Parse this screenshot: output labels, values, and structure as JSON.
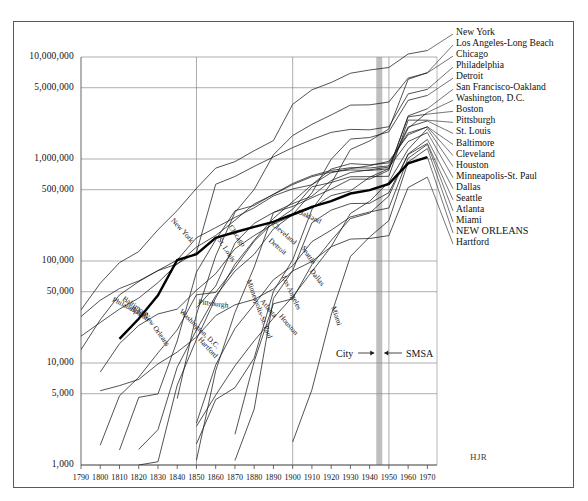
{
  "figure": {
    "signature": "HJR",
    "annotation": {
      "left_label": "City",
      "right_label": "SMSA",
      "band_year": 1945
    },
    "colors": {
      "ink": "#1a1a1a",
      "grid": "#8a8a8a",
      "frame": "#5a5a5a",
      "band": "#b4b4b4",
      "highlight": "#000000"
    }
  },
  "chart_data": {
    "type": "line",
    "title": "",
    "subtitle": "",
    "xlabel": "",
    "ylabel": "",
    "scale": {
      "x": "linear",
      "y": "log"
    },
    "xlim": [
      1790,
      1975
    ],
    "ylim": [
      1000,
      10000000
    ],
    "grid": "both",
    "legend": "right-labels",
    "annotations": [
      {
        "text": "City",
        "x": 1925,
        "y": 17000
      },
      {
        "text": "SMSA",
        "x": 1958,
        "y": 17000
      },
      {
        "text": "HJR",
        "x": 1968,
        "y": 1500
      }
    ],
    "ytick_labels": [
      "10,000,000",
      "5,000,000",
      "1,000,000",
      "500,000",
      "100,000",
      "50,000",
      "10,000",
      "5,000",
      "1,000"
    ],
    "ytick_values": [
      10000000,
      5000000,
      1000000,
      500000,
      100000,
      50000,
      10000,
      5000,
      1000
    ],
    "gridline_values": [
      10000000,
      5000000,
      1000000,
      500000,
      100000,
      50000,
      10000,
      5000,
      1000
    ],
    "xtick_labels": [
      "1790",
      "1800",
      "1810",
      "1820",
      "1830",
      "1840",
      "1850",
      "1860",
      "1870",
      "1880",
      "1890",
      "1900",
      "1910",
      "1920",
      "1930",
      "1940",
      "1950",
      "1960",
      "1970"
    ],
    "xtick_values": [
      1790,
      1800,
      1810,
      1820,
      1830,
      1840,
      1850,
      1860,
      1870,
      1880,
      1890,
      1900,
      1910,
      1920,
      1930,
      1940,
      1950,
      1960,
      1970
    ],
    "xgridline_values": [
      1850,
      1900,
      1950
    ],
    "highlight_series": "NEW ORLEANS",
    "series": [
      {
        "name": "New York",
        "right_label": "New York",
        "inline_label": "New York",
        "inline_at": 1838,
        "highlight": false,
        "x": [
          1790,
          1800,
          1810,
          1820,
          1830,
          1840,
          1850,
          1860,
          1870,
          1880,
          1890,
          1900,
          1910,
          1920,
          1930,
          1940,
          1950,
          1960,
          1970
        ],
        "y": [
          33131,
          60515,
          96373,
          123706,
          202589,
          312710,
          515547,
          813669,
          942292,
          1206299,
          1515301,
          3437202,
          4766883,
          5620048,
          6930446,
          7454995,
          7891957,
          10694633,
          11571899
        ]
      },
      {
        "name": "Los Angeles-Long Beach",
        "right_label": "Los Angeles-Long Beach",
        "inline_label": "Los Angeles",
        "inline_at": 1896,
        "highlight": false,
        "x": [
          1850,
          1860,
          1870,
          1880,
          1890,
          1900,
          1910,
          1920,
          1930,
          1940,
          1950,
          1960,
          1970
        ],
        "y": [
          1610,
          4385,
          5728,
          11183,
          50395,
          102479,
          319198,
          576673,
          1238048,
          1504277,
          1970358,
          6038771,
          7032075
        ]
      },
      {
        "name": "Chicago",
        "right_label": "Chicago",
        "inline_label": "Chicago",
        "inline_at": 1868,
        "highlight": false,
        "x": [
          1840,
          1850,
          1860,
          1870,
          1880,
          1890,
          1900,
          1910,
          1920,
          1930,
          1940,
          1950,
          1960,
          1970
        ],
        "y": [
          4470,
          29963,
          112172,
          298977,
          503185,
          1099850,
          1698575,
          2185283,
          2701705,
          3376438,
          3396808,
          3620962,
          6220913,
          6978947
        ]
      },
      {
        "name": "Philadelphia",
        "right_label": "Philadelphia",
        "inline_label": "Philadelphia",
        "inline_at": 1806,
        "highlight": false,
        "x": [
          1790,
          1800,
          1810,
          1820,
          1830,
          1840,
          1850,
          1860,
          1870,
          1880,
          1890,
          1900,
          1910,
          1920,
          1930,
          1940,
          1950,
          1960,
          1970
        ],
        "y": [
          28522,
          41220,
          53722,
          63802,
          80462,
          93665,
          121376,
          565529,
          674022,
          847170,
          1046964,
          1293697,
          1549008,
          1823779,
          1950961,
          1931334,
          2071605,
          4342897,
          4817914
        ]
      },
      {
        "name": "Detroit",
        "right_label": "Detroit",
        "inline_label": "Detroit",
        "inline_at": 1888,
        "highlight": false,
        "x": [
          1820,
          1830,
          1840,
          1850,
          1860,
          1870,
          1880,
          1890,
          1900,
          1910,
          1920,
          1930,
          1940,
          1950,
          1960,
          1970
        ],
        "y": [
          1422,
          2222,
          9102,
          21019,
          45619,
          79577,
          116340,
          205876,
          285704,
          465766,
          993678,
          1568662,
          1623452,
          1849568,
          3762360,
          4199931
        ]
      },
      {
        "name": "San Francisco-Oakland",
        "right_label": "San Francisco-Oakland",
        "inline_label": "Oakland",
        "inline_at": 1902,
        "highlight": false,
        "x": [
          1850,
          1860,
          1870,
          1880,
          1890,
          1900,
          1910,
          1920,
          1930,
          1940,
          1950,
          1960,
          1970
        ],
        "y": [
          34776,
          56802,
          149473,
          233959,
          298997,
          342782,
          416912,
          506676,
          634394,
          634536,
          775357,
          2648762,
          3109519
        ]
      },
      {
        "name": "Washington, D.C.",
        "right_label": "Washington, D.C.",
        "inline_label": "Washington, D.C.",
        "inline_at": 1842,
        "highlight": false,
        "x": [
          1800,
          1810,
          1820,
          1830,
          1840,
          1850,
          1860,
          1870,
          1880,
          1890,
          1900,
          1910,
          1920,
          1930,
          1940,
          1950,
          1960,
          1970
        ],
        "y": [
          8144,
          15471,
          23336,
          30261,
          33745,
          51687,
          75080,
          131700,
          177624,
          230392,
          278718,
          331069,
          437571,
          486869,
          663091,
          802178,
          2001897,
          2861123
        ]
      },
      {
        "name": "Boston",
        "right_label": "Boston",
        "inline_label": "Boston",
        "inline_at": 1816,
        "highlight": false,
        "x": [
          1790,
          1800,
          1810,
          1820,
          1830,
          1840,
          1850,
          1860,
          1870,
          1880,
          1890,
          1900,
          1910,
          1920,
          1930,
          1940,
          1950,
          1960,
          1970
        ],
        "y": [
          18320,
          24937,
          33787,
          43298,
          61392,
          93383,
          136881,
          177840,
          250526,
          362839,
          448477,
          560892,
          670585,
          748060,
          781188,
          770816,
          801444,
          2589301,
          2753700
        ]
      },
      {
        "name": "Pittsburgh",
        "right_label": "Pittsburgh",
        "inline_label": "Pittsburgh",
        "inline_at": 1850,
        "highlight": false,
        "x": [
          1800,
          1810,
          1820,
          1830,
          1840,
          1850,
          1860,
          1870,
          1880,
          1890,
          1900,
          1910,
          1920,
          1930,
          1940,
          1950,
          1960,
          1970
        ],
        "y": [
          1565,
          4768,
          7248,
          12568,
          21115,
          46601,
          49221,
          86076,
          156389,
          238617,
          321616,
          533905,
          588343,
          669817,
          671659,
          676806,
          2405435,
          2401245
        ]
      },
      {
        "name": "St. Louis",
        "right_label": "St. Louis",
        "inline_label": "St. Louis",
        "inline_at": 1862,
        "highlight": false,
        "x": [
          1810,
          1820,
          1830,
          1840,
          1850,
          1860,
          1870,
          1880,
          1890,
          1900,
          1910,
          1920,
          1930,
          1940,
          1950,
          1960,
          1970
        ],
        "y": [
          1400,
          4598,
          4977,
          16469,
          77860,
          160773,
          310864,
          350518,
          451770,
          575238,
          687029,
          772897,
          821960,
          816048,
          856796,
          2060103,
          2363017
        ]
      },
      {
        "name": "Baltimore",
        "right_label": "Baltimore",
        "inline_label": "Baltimore",
        "inline_at": 1812,
        "highlight": false,
        "x": [
          1790,
          1800,
          1810,
          1820,
          1830,
          1840,
          1850,
          1860,
          1870,
          1880,
          1890,
          1900,
          1910,
          1920,
          1930,
          1940,
          1950,
          1960,
          1970
        ],
        "y": [
          13503,
          26514,
          46555,
          62738,
          80620,
          102313,
          169054,
          212418,
          267354,
          332313,
          434439,
          508957,
          558485,
          733826,
          804874,
          859100,
          949708,
          1727023,
          2070670
        ]
      },
      {
        "name": "Cleveland",
        "right_label": "Cleveland",
        "inline_label": "Cleveland",
        "inline_at": 1890,
        "highlight": false,
        "x": [
          1820,
          1830,
          1840,
          1850,
          1860,
          1870,
          1880,
          1890,
          1900,
          1910,
          1920,
          1930,
          1940,
          1950,
          1960,
          1970
        ],
        "y": [
          606,
          1076,
          6071,
          17034,
          43417,
          92829,
          160146,
          261353,
          381768,
          560663,
          796841,
          900429,
          878336,
          914808,
          1796595,
          2064194
        ]
      },
      {
        "name": "Houston",
        "right_label": "Houston",
        "inline_label": "Houston",
        "inline_at": 1894,
        "highlight": false,
        "x": [
          1850,
          1860,
          1870,
          1880,
          1890,
          1900,
          1910,
          1920,
          1930,
          1940,
          1950,
          1960,
          1970
        ],
        "y": [
          2396,
          4845,
          9382,
          16513,
          27557,
          44633,
          78800,
          138276,
          292352,
          384514,
          596163,
          1243158,
          1985031
        ]
      },
      {
        "name": "Minneapolis-St. Paul",
        "right_label": "Minneapolis-St. Paul",
        "inline_label": "Minneapolis-St. Paul",
        "inline_at": 1878,
        "highlight": false,
        "x": [
          1850,
          1860,
          1870,
          1880,
          1890,
          1900,
          1910,
          1920,
          1930,
          1940,
          1950,
          1960,
          1970
        ],
        "y": [
          1112,
          8413,
          31278,
          87233,
          298300,
          365500,
          431500,
          615000,
          736000,
          784000,
          833000,
          1482030,
          1813647
        ]
      },
      {
        "name": "Dallas",
        "right_label": "Dallas",
        "inline_label": "Dallas",
        "inline_at": 1910,
        "highlight": false,
        "x": [
          1870,
          1880,
          1890,
          1900,
          1910,
          1920,
          1930,
          1940,
          1950,
          1960,
          1970
        ],
        "y": [
          2000,
          10358,
          38067,
          42638,
          92104,
          158976,
          260475,
          294734,
          434462,
          1119410,
          1555950
        ]
      },
      {
        "name": "Seattle",
        "right_label": "Seattle",
        "inline_label": "Seattle",
        "inline_at": 1906,
        "highlight": false,
        "x": [
          1870,
          1880,
          1890,
          1900,
          1910,
          1920,
          1930,
          1940,
          1950,
          1960,
          1970
        ],
        "y": [
          1107,
          3533,
          42837,
          80671,
          237194,
          315312,
          365583,
          368302,
          467591,
          1107213,
          1421869
        ]
      },
      {
        "name": "Atlanta",
        "right_label": "Atlanta",
        "inline_label": "Atlanta",
        "inline_at": 1884,
        "highlight": false,
        "x": [
          1850,
          1860,
          1870,
          1880,
          1890,
          1900,
          1910,
          1920,
          1930,
          1940,
          1950,
          1960,
          1970
        ],
        "y": [
          2572,
          9554,
          21789,
          37409,
          65533,
          89872,
          154839,
          200616,
          270366,
          302288,
          331314,
          1017188,
          1390164
        ]
      },
      {
        "name": "Miami",
        "right_label": "Miami",
        "inline_label": "Miami",
        "inline_at": 1922,
        "highlight": false,
        "x": [
          1900,
          1910,
          1920,
          1930,
          1940,
          1950,
          1960,
          1970
        ],
        "y": [
          1681,
          5471,
          29571,
          110637,
          172172,
          249276,
          935047,
          1267792
        ]
      },
      {
        "name": "NEW ORLEANS",
        "right_label": "NEW ORLEANS",
        "inline_label": "New Orleans",
        "inline_at": 1824,
        "highlight": true,
        "x": [
          1810,
          1820,
          1830,
          1840,
          1850,
          1860,
          1870,
          1880,
          1890,
          1900,
          1910,
          1920,
          1930,
          1940,
          1950,
          1960,
          1970
        ],
        "y": [
          17242,
          27176,
          46082,
          102193,
          116375,
          168675,
          191418,
          216090,
          242039,
          287104,
          339075,
          387219,
          458762,
          494537,
          570445,
          907123,
          1045809
        ]
      },
      {
        "name": "Hartford",
        "right_label": "Hartford",
        "inline_label": "Hartford",
        "inline_at": 1852,
        "highlight": false,
        "x": [
          1800,
          1810,
          1820,
          1830,
          1840,
          1850,
          1860,
          1870,
          1880,
          1890,
          1900,
          1910,
          1920,
          1930,
          1940,
          1950,
          1960,
          1970
        ],
        "y": [
          5347,
          6003,
          6901,
          9789,
          12793,
          17966,
          29152,
          37180,
          42015,
          53230,
          79850,
          98915,
          138036,
          164072,
          166267,
          177397,
          525207,
          663891
        ]
      }
    ]
  }
}
